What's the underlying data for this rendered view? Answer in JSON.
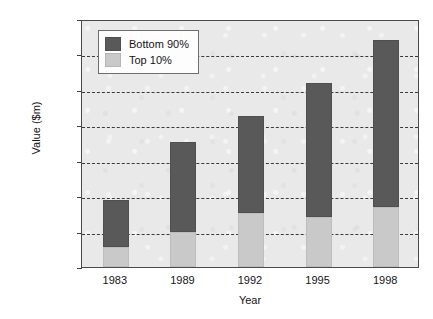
{
  "chart_data": {
    "type": "bar",
    "subtype": "stacked-vertical",
    "title": "",
    "xlabel": "Year",
    "ylabel": "Value ($m)",
    "categories": [
      "1983",
      "1989",
      "1992",
      "1995",
      "1998"
    ],
    "series": [
      {
        "name": "Top 10%",
        "color": "#c9c9c9",
        "values": [
          570000,
          990000,
          1530000,
          1410000,
          1690000
        ]
      },
      {
        "name": "Bottom 90%",
        "color": "#595959",
        "values": [
          1320000,
          2540000,
          2740000,
          3790000,
          4720000
        ]
      }
    ],
    "totals": [
      1890000,
      3530000,
      4270000,
      5200000,
      6410000
    ],
    "stack_order_bottom_to_top": [
      "Top 10%",
      "Bottom 90%"
    ],
    "ylim": [
      0,
      7000000
    ],
    "ytick_values": [
      0,
      1000000,
      2000000,
      3000000,
      4000000,
      5000000,
      6000000,
      7000000
    ],
    "ytick_labels": [
      "0",
      "1,000,000",
      "2,000,000",
      "3,000,000",
      "4,000,000",
      "5,000,000",
      "6,000,000",
      "7,000,000"
    ],
    "grid": "horizontal-dashed",
    "legend_position": "top-left-inside",
    "plot_background": "#e9e9e9",
    "frame": true
  },
  "axes": {
    "y": {
      "title": "Value ($m)",
      "ticks": [
        {
          "label": "7,000,000",
          "value": 7000000
        },
        {
          "label": "6,000,000",
          "value": 6000000
        },
        {
          "label": "5,000,000",
          "value": 5000000
        },
        {
          "label": "4,000,000",
          "value": 4000000
        },
        {
          "label": "3,000,000",
          "value": 3000000
        },
        {
          "label": "2,000,000",
          "value": 2000000
        },
        {
          "label": "1,000,000",
          "value": 1000000
        },
        {
          "label": "0",
          "value": 0
        }
      ]
    },
    "x": {
      "title": "Year",
      "ticks": [
        {
          "label": "1983"
        },
        {
          "label": "1989"
        },
        {
          "label": "1992"
        },
        {
          "label": "1995"
        },
        {
          "label": "1998"
        }
      ]
    }
  },
  "legend": {
    "entries": [
      {
        "label": "Bottom 90%",
        "color": "#595959"
      },
      {
        "label": "Top 10%",
        "color": "#c9c9c9"
      }
    ]
  }
}
